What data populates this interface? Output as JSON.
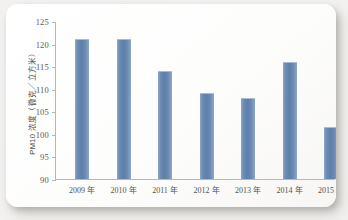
{
  "chart_data": {
    "type": "bar",
    "title": "",
    "xlabel": "",
    "ylabel": "PM10 浓度（微克／立方米）",
    "ylim": [
      90,
      125
    ],
    "yticks": [
      90,
      95,
      100,
      105,
      110,
      115,
      120,
      125
    ],
    "grid": false,
    "legend": null,
    "bar_color": "#5d7fab",
    "categories": [
      "2009 年",
      "2010 年",
      "2011 年",
      "2012 年",
      "2013 年",
      "2014 年",
      "2015 年"
    ],
    "values": [
      121,
      121,
      114,
      109,
      108,
      116,
      101.5
    ],
    "points": [
      {
        "category": "2009 年",
        "value": 121
      },
      {
        "category": "2010 年",
        "value": 121
      },
      {
        "category": "2011 年",
        "value": 114
      },
      {
        "category": "2012 年",
        "value": 109
      },
      {
        "category": "2013 年",
        "value": 108
      },
      {
        "category": "2014 年",
        "value": 116
      },
      {
        "category": "2015 年",
        "value": 101.5
      }
    ]
  }
}
